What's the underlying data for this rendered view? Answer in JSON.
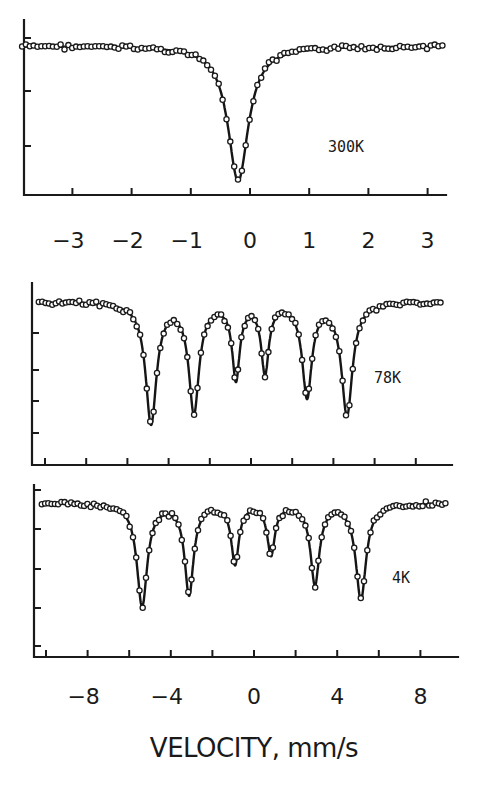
{
  "figure": {
    "xlabel": "VELOCITY, mm/s",
    "panels": [
      {
        "id": "300K",
        "label": "300K"
      },
      {
        "id": "78K",
        "label": "78K"
      },
      {
        "id": "4K",
        "label": "4K"
      }
    ]
  },
  "chart_data": [
    {
      "type": "scatter",
      "title": "",
      "panel_label": "300K",
      "xlabel": "",
      "ylabel": "",
      "x_ticks": [
        -3,
        -2,
        -1,
        0,
        1,
        2,
        3
      ],
      "x_tick_labels": [
        "-3",
        "-2",
        "-1",
        "0",
        "1",
        "2",
        "3"
      ],
      "xlim": [
        -3.9,
        3.3
      ],
      "y_ticks_unlabeled": 3,
      "ylim_relative": [
        0.0,
        1.05
      ],
      "grid": false,
      "legend": "none",
      "series": [
        {
          "name": "data (open circles) + fit (solid line)",
          "baseline_relative_transmission": 1.0,
          "lines": [
            {
              "center_mm_s": -0.2,
              "min_relative_transmission": 0.12,
              "fwhm_mm_s": 0.42
            }
          ]
        }
      ],
      "description": "Single broad absorption line (singlet) centered near -0.2 mm/s"
    },
    {
      "type": "scatter",
      "title": "",
      "panel_label": "78K",
      "xlabel": "",
      "ylabel": "",
      "x_ticks": [
        -10,
        -8,
        -6,
        -4,
        -2,
        0,
        2,
        4,
        6,
        8
      ],
      "xlim": [
        -10.6,
        9.4
      ],
      "y_ticks_unlabeled": 4,
      "ylim_relative": [
        0.0,
        1.05
      ],
      "grid": false,
      "legend": "none",
      "series": [
        {
          "name": "data (open circles) + fit (solid line)",
          "baseline_relative_transmission": 1.0,
          "lines": [
            {
              "center_mm_s": -4.85,
              "min_relative_transmission": 0.28
            },
            {
              "center_mm_s": -2.77,
              "min_relative_transmission": 0.35
            },
            {
              "center_mm_s": -0.73,
              "min_relative_transmission": 0.55
            },
            {
              "center_mm_s": 0.68,
              "min_relative_transmission": 0.58
            },
            {
              "center_mm_s": 2.72,
              "min_relative_transmission": 0.45
            },
            {
              "center_mm_s": 4.66,
              "min_relative_transmission": 0.33
            }
          ]
        }
      ],
      "description": "Magnetically split six-line sextet"
    },
    {
      "type": "scatter",
      "title": "",
      "panel_label": "4K",
      "xlabel": "VELOCITY, mm/s",
      "ylabel": "",
      "x_ticks": [
        -10,
        -8,
        -6,
        -4,
        -2,
        0,
        2,
        4,
        6,
        8
      ],
      "x_tick_labels": [
        "-8",
        "-4",
        "0",
        "4",
        "8"
      ],
      "x_tick_label_values": [
        -8,
        -4,
        0,
        4,
        8
      ],
      "xlim": [
        -10.6,
        9.4
      ],
      "y_ticks_unlabeled": 4,
      "ylim_relative": [
        0.0,
        1.05
      ],
      "grid": false,
      "legend": "none",
      "series": [
        {
          "name": "data (open circles) + fit (solid line)",
          "baseline_relative_transmission": 1.0,
          "lines": [
            {
              "center_mm_s": -5.38,
              "min_relative_transmission": 0.28
            },
            {
              "center_mm_s": -3.12,
              "min_relative_transmission": 0.36
            },
            {
              "center_mm_s": -0.91,
              "min_relative_transmission": 0.55
            },
            {
              "center_mm_s": 0.82,
              "min_relative_transmission": 0.6
            },
            {
              "center_mm_s": 2.93,
              "min_relative_transmission": 0.42
            },
            {
              "center_mm_s": 5.14,
              "min_relative_transmission": 0.33
            }
          ]
        }
      ],
      "description": "Six-line sextet with slightly larger splitting than at 78K"
    }
  ],
  "render": {
    "panels": [
      {
        "id": "300K",
        "axis": {
          "left": 24,
          "top": 20,
          "bottom": 195,
          "right": 446
        },
        "x0_px": 250,
        "px_per_unit": 59.2,
        "baseline_y": 46,
        "min_y": 181,
        "ytick_ys": [
          38,
          91,
          146
        ],
        "xtick_values": [
          -3,
          -2,
          -1,
          0,
          1,
          2,
          3
        ],
        "xtick_labels": [
          {
            "v": -3,
            "t": "-3"
          },
          {
            "v": -2,
            "t": "-2"
          },
          {
            "v": -1,
            "t": "-1"
          },
          {
            "v": 0,
            "t": "0"
          },
          {
            "v": 1,
            "t": "1"
          },
          {
            "v": 2,
            "t": "2"
          },
          {
            "v": 3,
            "t": "3"
          }
        ],
        "xtick_label_y": 248,
        "data_x_range": [
          -3.85,
          3.25
        ],
        "label_pos": [
          328,
          152
        ],
        "peaks": [
          {
            "c": -0.2,
            "depth": 1.0,
            "w": 0.21
          }
        ],
        "n_points": 110
      },
      {
        "id": "78K",
        "axis": {
          "left": 32,
          "top": 283,
          "bottom": 465,
          "right": 452
        },
        "x0_px": 251,
        "px_per_unit": 20.6,
        "baseline_y": 302,
        "min_y": 425,
        "ytick_ys": [
          333,
          370,
          401,
          433
        ],
        "xtick_values": [
          -10,
          -8,
          -6,
          -4,
          -2,
          0,
          2,
          4,
          6,
          8
        ],
        "xtick_labels": [],
        "data_x_range": [
          -10.3,
          9.2
        ],
        "label_pos": [
          374,
          383
        ],
        "peaks": [
          {
            "c": -4.85,
            "depth": 1.0,
            "w": 0.32
          },
          {
            "c": -2.77,
            "depth": 0.9,
            "w": 0.3
          },
          {
            "c": -0.73,
            "depth": 0.62,
            "w": 0.22
          },
          {
            "c": 0.68,
            "depth": 0.57,
            "w": 0.22
          },
          {
            "c": 2.72,
            "depth": 0.77,
            "w": 0.28
          },
          {
            "c": 4.66,
            "depth": 0.93,
            "w": 0.32
          }
        ],
        "n_points": 120
      },
      {
        "id": "4K",
        "axis": {
          "left": 34,
          "top": 485,
          "bottom": 657,
          "right": 458
        },
        "x0_px": 254,
        "px_per_unit": 20.8,
        "baseline_y": 503,
        "min_y": 607,
        "ytick_ys": [
          490,
          529,
          569,
          608,
          646
        ],
        "xtick_values": [
          -10,
          -8,
          -6,
          -4,
          -2,
          0,
          2,
          4,
          6,
          8
        ],
        "xtick_labels": [
          {
            "v": -8,
            "t": "-8"
          },
          {
            "v": -4,
            "t": "-4"
          },
          {
            "v": 0,
            "t": "0"
          },
          {
            "v": 4,
            "t": "4"
          },
          {
            "v": 8,
            "t": "8"
          }
        ],
        "xtick_label_y": 704,
        "data_x_range": [
          -10.2,
          9.2
        ],
        "label_pos": [
          392,
          583
        ],
        "peaks": [
          {
            "c": -5.38,
            "depth": 1.0,
            "w": 0.3
          },
          {
            "c": -3.12,
            "depth": 0.88,
            "w": 0.26
          },
          {
            "c": -0.91,
            "depth": 0.58,
            "w": 0.22
          },
          {
            "c": 0.82,
            "depth": 0.49,
            "w": 0.22
          },
          {
            "c": 2.93,
            "depth": 0.78,
            "w": 0.26
          },
          {
            "c": 5.14,
            "depth": 0.93,
            "w": 0.3
          }
        ],
        "n_points": 125
      }
    ],
    "xlabel_pos": [
      254,
      757
    ]
  }
}
